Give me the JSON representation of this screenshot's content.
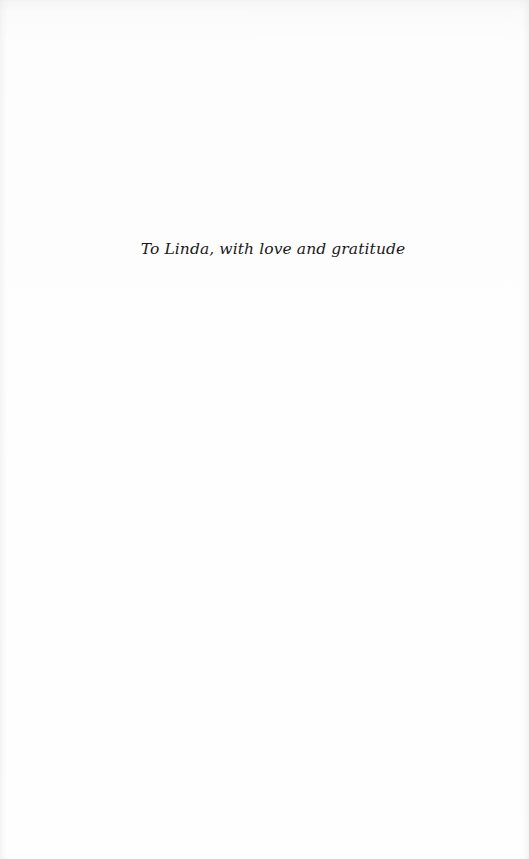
{
  "page": {
    "dedication": "To Linda, with love and gratitude"
  }
}
